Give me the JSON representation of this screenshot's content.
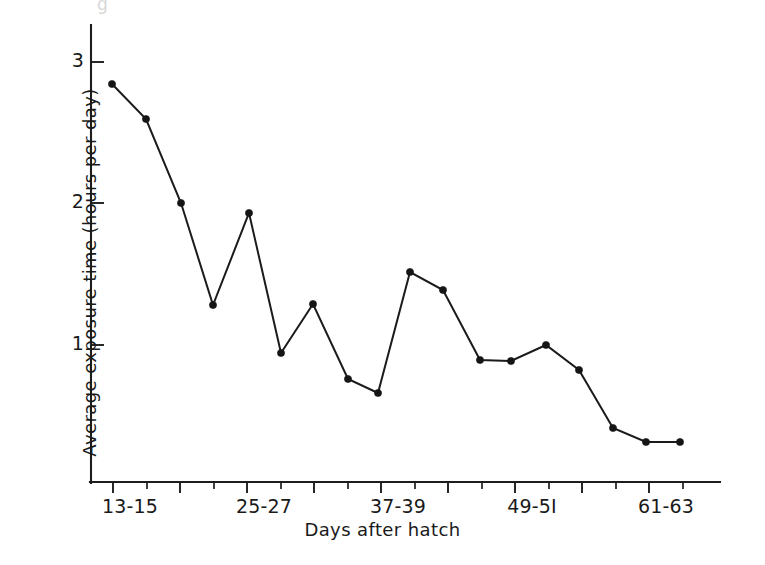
{
  "figure": {
    "background_color": "#ffffff",
    "ink_color": "#1b1b1b",
    "partial_caption_fragment": "g"
  },
  "chart_data": {
    "type": "line",
    "title": "",
    "subtitle": "",
    "xlabel": "Days after hatch",
    "ylabel": "Average exposure time (hours per day)",
    "xlim": [
      11.5,
      67.0
    ],
    "ylim": [
      0.0,
      3.25
    ],
    "grid": false,
    "legend": null,
    "y_ticks": [
      1,
      2,
      3
    ],
    "y_tick_labels": [
      "1",
      "2",
      "3"
    ],
    "x_tick_labels": [
      "13-15",
      "25-27",
      "37-39",
      "49-5I",
      "61-63"
    ],
    "x_major_tick_values": [
      14,
      20,
      26,
      32,
      38,
      44,
      50,
      56,
      62
    ],
    "x_minor_tick_values": [
      17,
      23,
      29,
      35,
      41,
      47,
      53,
      59,
      65
    ],
    "x_labeled_tick_values": [
      14,
      26,
      38,
      50,
      62
    ],
    "marker": "filled-circle",
    "categories": [
      "13-15",
      "16-18",
      "19-21",
      "22-24",
      "25-27",
      "28-30",
      "31-33",
      "34-36",
      "37-39",
      "40-42",
      "43-45",
      "46-48",
      "49-51",
      "52-54",
      "55-57",
      "58-60",
      "61-63",
      "64-66"
    ],
    "x": [
      14,
      20,
      26,
      32,
      38,
      44,
      50,
      56,
      62,
      68,
      74,
      80,
      86,
      92,
      98,
      104,
      110,
      116
    ],
    "values": [
      2.85,
      2.6,
      2.0,
      1.27,
      1.92,
      0.94,
      1.27,
      0.75,
      0.66,
      1.5,
      1.38,
      0.89,
      0.89,
      0.99,
      0.82,
      0.41,
      0.31,
      0.31
    ],
    "series": [
      {
        "name": "Average exposure time",
        "values": [
          2.85,
          2.6,
          2.0,
          1.27,
          1.92,
          0.94,
          1.27,
          0.75,
          0.66,
          1.5,
          1.38,
          0.89,
          0.89,
          0.99,
          0.82,
          0.41,
          0.31,
          0.31
        ]
      }
    ],
    "pixel_points": [
      [
        112,
        84
      ],
      [
        146,
        119
      ],
      [
        181,
        203
      ],
      [
        213,
        305
      ],
      [
        249,
        213
      ],
      [
        281,
        353
      ],
      [
        313,
        304
      ],
      [
        348,
        379
      ],
      [
        378,
        393
      ],
      [
        410,
        272
      ],
      [
        443,
        290
      ],
      [
        480,
        360
      ],
      [
        511,
        361
      ],
      [
        546,
        345
      ],
      [
        579,
        370
      ],
      [
        613,
        428
      ],
      [
        646,
        442
      ],
      [
        680,
        442
      ]
    ]
  },
  "axes": {
    "y_axis_label": "Average exposure time (hours per day)",
    "x_axis_label": "Days after hatch",
    "y_tick_labels": [
      {
        "text": "3",
        "top": 49
      },
      {
        "text": "2",
        "top": 190
      },
      {
        "text": "1",
        "top": 332
      }
    ],
    "x_tick_labels": [
      {
        "text": "13-15",
        "left": 130
      },
      {
        "text": "25-27",
        "left": 264
      },
      {
        "text": "37-39",
        "left": 398
      },
      {
        "text": "49-5I",
        "left": 532
      },
      {
        "text": "61-63",
        "left": 666
      }
    ]
  }
}
